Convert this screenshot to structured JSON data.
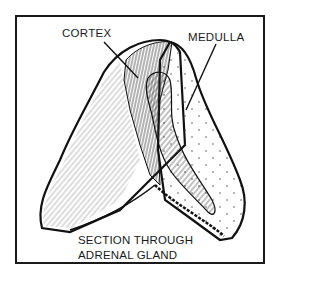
{
  "figure": {
    "labels": {
      "cortex": "CORTEX",
      "medulla": "MEDULLA"
    },
    "caption": {
      "line1": "SECTION THROUGH",
      "line2": "ADRENAL GLAND"
    }
  }
}
